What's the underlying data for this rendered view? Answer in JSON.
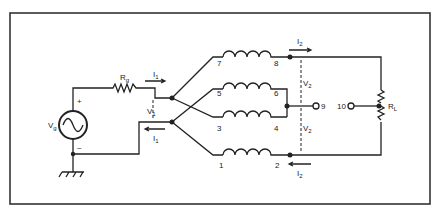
{
  "diagram": {
    "type": "circuit-schematic",
    "source": {
      "label": "V",
      "sub": "g",
      "plus": "+",
      "minus": "–"
    },
    "source_resistor": {
      "label": "R",
      "sub": "g"
    },
    "load_resistor": {
      "label": "R",
      "sub": "L"
    },
    "input_current": {
      "label": "I",
      "sub": "1"
    },
    "input_voltage": {
      "label": "V",
      "sub": "1"
    },
    "output_current": {
      "label": "I",
      "sub": "2"
    },
    "output_voltage": {
      "label": "V",
      "sub": "2"
    },
    "terminals": [
      "1",
      "2",
      "3",
      "4",
      "5",
      "6",
      "7",
      "8",
      "9",
      "10"
    ],
    "colors": {
      "line": "#222222",
      "background": "#ffffff",
      "frame": "#333333"
    }
  }
}
